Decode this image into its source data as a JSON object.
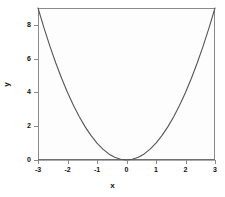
{
  "chart_data": {
    "type": "line",
    "title": "",
    "xlabel": "x",
    "ylabel": "y",
    "xlim": [
      -3,
      3
    ],
    "ylim": [
      0,
      9
    ],
    "grid": false,
    "legend": null,
    "xticks": [
      -3,
      -2,
      -1,
      0,
      1,
      2,
      3
    ],
    "xtick_labels": [
      "-3",
      "-2",
      "-1",
      "0",
      "1",
      "2",
      "3"
    ],
    "yticks": [
      0,
      2,
      4,
      6,
      8
    ],
    "ytick_labels": [
      "0",
      "2",
      "4",
      "6",
      "8"
    ],
    "series": [
      {
        "name": "y = x^2",
        "type": "line",
        "color": "#555555",
        "x": [
          -3,
          -2.8,
          -2.6,
          -2.4,
          -2.2,
          -2,
          -1.8,
          -1.6,
          -1.4,
          -1.2,
          -1,
          -0.8,
          -0.6,
          -0.4,
          -0.2,
          0,
          0.2,
          0.4,
          0.6,
          0.8,
          1,
          1.2,
          1.4,
          1.6,
          1.8,
          2,
          2.2,
          2.4,
          2.6,
          2.8,
          3
        ],
        "values": [
          9,
          7.84,
          6.76,
          5.76,
          4.84,
          4,
          3.24,
          2.56,
          1.96,
          1.44,
          1,
          0.64,
          0.36,
          0.16,
          0.04,
          0,
          0.04,
          0.16,
          0.36,
          0.64,
          1,
          1.44,
          1.96,
          2.56,
          3.24,
          4,
          4.84,
          5.76,
          6.76,
          7.84,
          9
        ]
      },
      {
        "name": "y = 0 reference line",
        "type": "hline",
        "color": "#555555",
        "y_value": 0
      }
    ]
  },
  "figure": {
    "background_color": "#ffffff",
    "frame_color": "#8a8a8a",
    "line_color": "#555555",
    "text_color": "#111111"
  }
}
